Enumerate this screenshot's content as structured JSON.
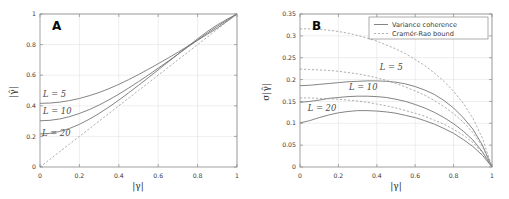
{
  "figure": {
    "panels": [
      {
        "letter": "A",
        "xlabel": "|γ|",
        "ylabel": "|γ̂|",
        "xticks": [
          "0",
          "0.2",
          "0.4",
          "0.6",
          "0.8",
          "1"
        ],
        "yticks": [
          "0",
          "0.2",
          "0.4",
          "0.6",
          "0.8",
          "1"
        ],
        "curve_labels": [
          "L = 5",
          "L = 10",
          "L = 20"
        ]
      },
      {
        "letter": "B",
        "xlabel": "|γ|",
        "ylabel": "σ|γ̂|",
        "xticks": [
          "0",
          "0.2",
          "0.4",
          "0.6",
          "0.8",
          "1"
        ],
        "yticks": [
          "0",
          "0.05",
          "0.1",
          "0.15",
          "0.2",
          "0.25",
          "0.3",
          "0.35"
        ],
        "curve_labels": [
          "L = 5",
          "L = 10",
          "L = 20"
        ],
        "legend": [
          {
            "label": "Variance coherence",
            "style": "solid"
          },
          {
            "label": "Cramér-Rao bound",
            "style": "dashed"
          }
        ]
      }
    ],
    "colors": {
      "curve_solid": "#6e6e6e",
      "curve_dashed": "#9a9a9a",
      "axis": "#8a8a8a",
      "grid": "#dcdcdc",
      "background": "#ffffff"
    }
  },
  "chart_data": [
    {
      "type": "line",
      "panel": "A",
      "title": "",
      "xlabel": "|γ|",
      "ylabel": "|γ̂|",
      "xlim": [
        0,
        1
      ],
      "ylim": [
        0,
        1
      ],
      "xticks": [
        0,
        0.2,
        0.4,
        0.6,
        0.8,
        1
      ],
      "yticks": [
        0,
        0.2,
        0.4,
        0.6,
        0.8,
        1
      ],
      "grid": true,
      "legend": "none",
      "x": [
        0,
        0.05,
        0.1,
        0.15,
        0.2,
        0.25,
        0.3,
        0.35,
        0.4,
        0.45,
        0.5,
        0.55,
        0.6,
        0.65,
        0.7,
        0.75,
        0.8,
        0.85,
        0.9,
        0.95,
        1
      ],
      "series": [
        {
          "name": "L = 5",
          "style": "solid",
          "values": [
            0.416,
            0.418,
            0.424,
            0.434,
            0.448,
            0.466,
            0.487,
            0.512,
            0.54,
            0.571,
            0.604,
            0.639,
            0.675,
            0.712,
            0.75,
            0.789,
            0.828,
            0.868,
            0.908,
            0.953,
            1.0
          ]
        },
        {
          "name": "L = 10",
          "style": "solid",
          "values": [
            0.302,
            0.305,
            0.314,
            0.329,
            0.35,
            0.375,
            0.405,
            0.439,
            0.476,
            0.516,
            0.558,
            0.601,
            0.646,
            0.691,
            0.737,
            0.784,
            0.83,
            0.876,
            0.919,
            0.96,
            1.0
          ]
        },
        {
          "name": "L = 20",
          "style": "solid",
          "values": [
            0.216,
            0.22,
            0.232,
            0.252,
            0.279,
            0.312,
            0.35,
            0.392,
            0.437,
            0.485,
            0.534,
            0.584,
            0.635,
            0.686,
            0.737,
            0.788,
            0.838,
            0.886,
            0.929,
            0.966,
            1.0
          ]
        },
        {
          "name": "identity reference",
          "style": "dashed",
          "values": [
            0.0,
            0.05,
            0.1,
            0.15,
            0.2,
            0.25,
            0.3,
            0.35,
            0.4,
            0.45,
            0.5,
            0.55,
            0.6,
            0.65,
            0.7,
            0.75,
            0.8,
            0.85,
            0.9,
            0.95,
            1.0
          ]
        }
      ]
    },
    {
      "type": "line",
      "panel": "B",
      "title": "",
      "xlabel": "|γ|",
      "ylabel": "σ|γ̂|",
      "xlim": [
        0,
        1
      ],
      "ylim": [
        0,
        0.35
      ],
      "xticks": [
        0,
        0.2,
        0.4,
        0.6,
        0.8,
        1
      ],
      "yticks": [
        0,
        0.05,
        0.1,
        0.15,
        0.2,
        0.25,
        0.3,
        0.35
      ],
      "grid": true,
      "legend": "upper right",
      "legend_entries": [
        "Variance coherence",
        "Cramér-Rao bound"
      ],
      "x": [
        0,
        0.05,
        0.1,
        0.15,
        0.2,
        0.25,
        0.3,
        0.35,
        0.4,
        0.45,
        0.5,
        0.55,
        0.6,
        0.65,
        0.7,
        0.75,
        0.8,
        0.85,
        0.9,
        0.95,
        1
      ],
      "series": [
        {
          "name": "L = 5 variance coherence",
          "style": "solid",
          "values": [
            0.186,
            0.187,
            0.189,
            0.191,
            0.193,
            0.195,
            0.196,
            0.197,
            0.197,
            0.196,
            0.194,
            0.19,
            0.184,
            0.176,
            0.166,
            0.152,
            0.135,
            0.113,
            0.087,
            0.05,
            0.0
          ]
        },
        {
          "name": "L = 10 variance coherence",
          "style": "solid",
          "values": [
            0.148,
            0.15,
            0.153,
            0.157,
            0.159,
            0.161,
            0.162,
            0.162,
            0.161,
            0.159,
            0.155,
            0.15,
            0.143,
            0.135,
            0.125,
            0.113,
            0.099,
            0.082,
            0.062,
            0.035,
            0.0
          ]
        },
        {
          "name": "L = 20 variance coherence",
          "style": "solid",
          "values": [
            0.101,
            0.106,
            0.113,
            0.119,
            0.124,
            0.127,
            0.129,
            0.129,
            0.128,
            0.126,
            0.123,
            0.118,
            0.113,
            0.106,
            0.098,
            0.088,
            0.077,
            0.063,
            0.047,
            0.027,
            0.0
          ]
        },
        {
          "name": "L = 5 Cramer-Rao bound",
          "style": "dashed",
          "values": [
            0.316,
            0.316,
            0.315,
            0.313,
            0.31,
            0.306,
            0.301,
            0.295,
            0.288,
            0.279,
            0.27,
            0.259,
            0.246,
            0.232,
            0.215,
            0.196,
            0.173,
            0.146,
            0.112,
            0.066,
            0.0
          ]
        },
        {
          "name": "L = 10 Cramer-Rao bound",
          "style": "dashed",
          "values": [
            0.224,
            0.223,
            0.222,
            0.221,
            0.219,
            0.216,
            0.213,
            0.209,
            0.204,
            0.198,
            0.191,
            0.183,
            0.174,
            0.164,
            0.152,
            0.138,
            0.122,
            0.103,
            0.079,
            0.047,
            0.0
          ]
        },
        {
          "name": "L = 20 Cramer-Rao bound",
          "style": "dashed",
          "values": [
            0.158,
            0.158,
            0.157,
            0.156,
            0.155,
            0.153,
            0.151,
            0.148,
            0.144,
            0.14,
            0.135,
            0.129,
            0.123,
            0.116,
            0.107,
            0.098,
            0.086,
            0.073,
            0.056,
            0.033,
            0.0
          ]
        }
      ]
    }
  ]
}
